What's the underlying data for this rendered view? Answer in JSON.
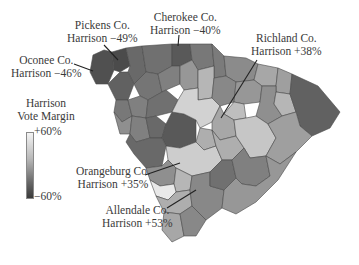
{
  "legend": {
    "title_line1": "Harrison",
    "title_line2": "Vote Margin",
    "max_label": "+60%",
    "min_label": "−60%",
    "color_high": "#f4f4f4",
    "color_low": "#3a3a3a"
  },
  "annotations": [
    {
      "county": "Pickens Co.",
      "text": "Harrison −49%",
      "margin": -49
    },
    {
      "county": "Cherokee Co.",
      "text": "Harrison −40%",
      "margin": -40
    },
    {
      "county": "Oconee Co.",
      "text": "Harrison −46%",
      "margin": -46
    },
    {
      "county": "Richland Co.",
      "text": "Harrison +38%",
      "margin": 38
    },
    {
      "county": "Orangeburg Co.",
      "text": "Harrison +35%",
      "margin": 35
    },
    {
      "county": "Allendale Co.",
      "text": "Harrison +53%",
      "margin": 53
    }
  ],
  "counties": [
    {
      "name": "Oconee",
      "margin": -46
    },
    {
      "name": "Pickens",
      "margin": -49
    },
    {
      "name": "Greenville",
      "margin": -30
    },
    {
      "name": "Spartanburg",
      "margin": -25
    },
    {
      "name": "Cherokee",
      "margin": -40
    },
    {
      "name": "York",
      "margin": -20
    },
    {
      "name": "Anderson",
      "margin": -35
    },
    {
      "name": "Laurens",
      "margin": -22
    },
    {
      "name": "Union",
      "margin": -15
    },
    {
      "name": "Chester",
      "margin": 0
    },
    {
      "name": "Lancaster",
      "margin": -18
    },
    {
      "name": "Chesterfield",
      "margin": -8
    },
    {
      "name": "Marlboro",
      "margin": 10
    },
    {
      "name": "Abbeville",
      "margin": -20
    },
    {
      "name": "Greenwood",
      "margin": -15
    },
    {
      "name": "Newberry",
      "margin": -25
    },
    {
      "name": "Fairfield",
      "margin": 20
    },
    {
      "name": "Kershaw",
      "margin": -10
    },
    {
      "name": "Darlington",
      "margin": 0
    },
    {
      "name": "Dillon",
      "margin": 5
    },
    {
      "name": "McCormick",
      "margin": -5
    },
    {
      "name": "Edgefield",
      "margin": -15
    },
    {
      "name": "Saluda",
      "margin": -30
    },
    {
      "name": "Lexington",
      "margin": -40
    },
    {
      "name": "Richland",
      "margin": 38
    },
    {
      "name": "Lee",
      "margin": 25
    },
    {
      "name": "Sumter",
      "margin": 10
    },
    {
      "name": "Florence",
      "margin": -5
    },
    {
      "name": "Marion",
      "margin": 20
    },
    {
      "name": "Horry",
      "margin": -35
    },
    {
      "name": "Aiken",
      "margin": -30
    },
    {
      "name": "Calhoun",
      "margin": 15
    },
    {
      "name": "Orangeburg",
      "margin": 35
    },
    {
      "name": "Clarendon",
      "margin": 15
    },
    {
      "name": "Williamsburg",
      "margin": 30
    },
    {
      "name": "Georgetown",
      "margin": 5
    },
    {
      "name": "Barnwell",
      "margin": -5
    },
    {
      "name": "Bamberg",
      "margin": 20
    },
    {
      "name": "Allendale",
      "margin": 53
    },
    {
      "name": "Hampton",
      "margin": 15
    },
    {
      "name": "Colleton",
      "margin": -10
    },
    {
      "name": "Dorchester",
      "margin": -25
    },
    {
      "name": "Berkeley",
      "margin": -15
    },
    {
      "name": "Charleston",
      "margin": 0
    },
    {
      "name": "Jasper",
      "margin": 10
    },
    {
      "name": "Beaufort",
      "margin": -10
    }
  ]
}
